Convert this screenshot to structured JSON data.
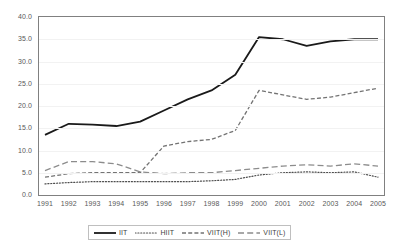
{
  "chart_data": {
    "type": "line",
    "title": "",
    "xlabel": "",
    "ylabel": "",
    "grid": true,
    "legend_position": "bottom",
    "xlim": [
      1991,
      2005
    ],
    "ylim": [
      0.0,
      40.0
    ],
    "ytick_step": 5.0,
    "x": [
      1991,
      1992,
      1993,
      1994,
      1995,
      1996,
      1997,
      1998,
      1999,
      2000,
      2001,
      2002,
      2003,
      2004,
      2005
    ],
    "categories": [
      "1991",
      "1992",
      "1993",
      "1994",
      "1995",
      "1996",
      "1997",
      "1998",
      "1999",
      "2000",
      "2001",
      "2002",
      "2003",
      "2004",
      "2005"
    ],
    "ytick_labels": [
      "40.0",
      "35.0",
      "30.0",
      "25.0",
      "20.0",
      "15.0",
      "10.0",
      "5.0",
      "0.0"
    ],
    "ytick_values": [
      40.0,
      35.0,
      30.0,
      25.0,
      20.0,
      15.0,
      10.0,
      5.0,
      0.0
    ],
    "series": [
      {
        "name": "IIT",
        "style": "solid",
        "color": "#1a1a1a",
        "width": 1.8,
        "values": [
          13.5,
          16.0,
          15.8,
          15.5,
          16.5,
          19.0,
          21.5,
          23.5,
          27.0,
          35.5,
          35.0,
          33.5,
          34.5,
          35.0,
          35.0
        ]
      },
      {
        "name": "HIIT",
        "style": "dotted",
        "color": "#4d4d4d",
        "width": 1.2,
        "values": [
          2.5,
          2.8,
          3.0,
          3.0,
          3.0,
          3.0,
          3.0,
          3.2,
          3.5,
          4.5,
          5.0,
          5.2,
          5.0,
          5.2,
          4.0
        ]
      },
      {
        "name": "VIIT(H)",
        "style": "dashed",
        "color": "#737373",
        "width": 1.3,
        "values": [
          4.0,
          4.8,
          5.0,
          5.0,
          5.0,
          11.0,
          12.0,
          12.5,
          14.5,
          23.5,
          22.5,
          21.5,
          22.0,
          23.0,
          24.0
        ]
      },
      {
        "name": "VIIT(L)",
        "style": "long-dashed",
        "color": "#8c8c8c",
        "width": 1.3,
        "values": [
          5.5,
          7.5,
          7.5,
          7.0,
          5.2,
          4.8,
          5.0,
          5.0,
          5.5,
          6.0,
          6.5,
          6.8,
          6.5,
          7.0,
          6.5
        ]
      }
    ]
  },
  "legend": {
    "entries": [
      {
        "label": "IIT"
      },
      {
        "label": "HIIT"
      },
      {
        "label": "VIIT(H)"
      },
      {
        "label": "VIIT(L)"
      }
    ]
  },
  "colors": {
    "plot_border": "#808080",
    "gridline": "#f2f2f2",
    "tick_text": "#595959",
    "legend_border": "#bfbfbf",
    "background": "#ffffff"
  }
}
